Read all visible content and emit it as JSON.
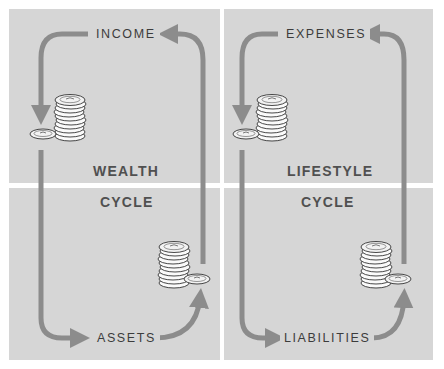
{
  "diagram": {
    "left": {
      "name": "wealth-cycle",
      "title_top": "WEALTH",
      "title_bottom": "CYCLE",
      "top_label": "INCOME",
      "bottom_label": "ASSETS"
    },
    "right": {
      "name": "lifestyle-cycle",
      "title_top": "LIFESTYLE",
      "title_bottom": "CYCLE",
      "top_label": "EXPENSES",
      "bottom_label": "LIABILITIES"
    },
    "colors": {
      "panel": "#d6d6d6",
      "arrow": "#8c8c8c",
      "label": "#3c3c3c",
      "title": "#505050",
      "background": "#ffffff"
    },
    "icons": [
      "coin-stack-icon",
      "single-coin-icon",
      "arrow-icon"
    ]
  }
}
